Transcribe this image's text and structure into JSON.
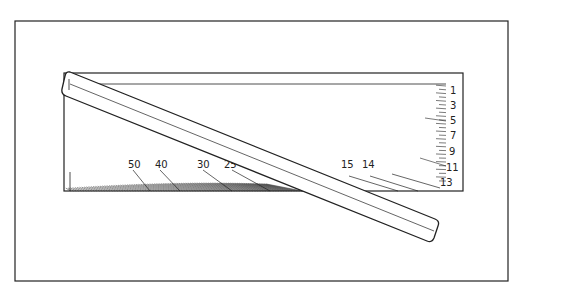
{
  "diagram": {
    "colors": {
      "stroke": "#222222",
      "background": "#ffffff"
    },
    "frame": {
      "x": 15,
      "y": 21,
      "w": 493,
      "h": 260
    },
    "card": {
      "x": 64,
      "y": 73,
      "w": 399,
      "h": 118
    },
    "right_scale_labels": [
      {
        "text": "1",
        "x": 450,
        "y": 94
      },
      {
        "text": "3",
        "x": 450,
        "y": 109
      },
      {
        "text": "5",
        "x": 450,
        "y": 124
      },
      {
        "text": "7",
        "x": 450,
        "y": 139
      },
      {
        "text": "9",
        "x": 449,
        "y": 155
      },
      {
        "text": "11",
        "x": 446,
        "y": 171
      },
      {
        "text": "13",
        "x": 440,
        "y": 186
      }
    ],
    "bottom_scale_labels": [
      {
        "text": "50",
        "x": 128,
        "y": 168
      },
      {
        "text": "40",
        "x": 155,
        "y": 168
      },
      {
        "text": "30",
        "x": 197,
        "y": 168
      },
      {
        "text": "25",
        "x": 224,
        "y": 168
      },
      {
        "text": "20",
        "x": 261,
        "y": 168
      },
      {
        "text": "15",
        "x": 341,
        "y": 168
      },
      {
        "text": "14",
        "x": 362,
        "y": 168
      }
    ],
    "ruler": {
      "label": "transparent ruler",
      "angle_deg": 22
    }
  }
}
